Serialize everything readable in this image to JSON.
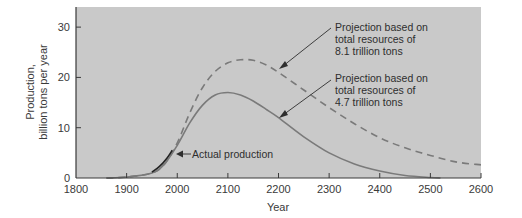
{
  "chart_data": {
    "type": "line",
    "title": "",
    "xlabel": "Year",
    "ylabel_lines": [
      "Production,",
      "billion tons per year"
    ],
    "ylabel": "Production, billion tons per year",
    "xlim": [
      1800,
      2600
    ],
    "ylim": [
      0,
      34
    ],
    "x_ticks": [
      1800,
      1900,
      2000,
      2100,
      2200,
      2300,
      2400,
      2500,
      2600
    ],
    "y_ticks": [
      0,
      10,
      20,
      30
    ],
    "grid": false,
    "background": "#c9c9c9",
    "series": [
      {
        "name": "Projection based on total resources of 4.7 trillion tons",
        "style": "solid",
        "color": "#7a7a7a",
        "x": [
          1860,
          1900,
          1950,
          1975,
          2000,
          2025,
          2050,
          2075,
          2100,
          2125,
          2150,
          2175,
          2200,
          2250,
          2300,
          2350,
          2400,
          2450,
          2500,
          2520
        ],
        "y": [
          0,
          0.2,
          1.0,
          2.8,
          6.5,
          11.0,
          14.5,
          16.5,
          17.0,
          16.5,
          15.3,
          13.7,
          12.0,
          8.2,
          5.0,
          2.8,
          1.4,
          0.5,
          0.1,
          0
        ]
      },
      {
        "name": "Projection based on total resources of 8.1 trillion tons",
        "style": "dashed",
        "color": "#7a7a7a",
        "x": [
          1860,
          1900,
          1950,
          1975,
          2000,
          2025,
          2050,
          2075,
          2100,
          2125,
          2150,
          2175,
          2200,
          2250,
          2300,
          2350,
          2400,
          2450,
          2500,
          2550,
          2600
        ],
        "y": [
          0,
          0.2,
          1.0,
          2.8,
          7.0,
          13.0,
          18.0,
          21.2,
          22.9,
          23.5,
          23.4,
          22.5,
          21.0,
          17.5,
          14.0,
          10.8,
          8.0,
          6.0,
          4.5,
          3.2,
          2.6
        ]
      },
      {
        "name": "Actual production",
        "style": "solid-dark",
        "color": "#222222",
        "x": [
          1950,
          1965,
          1980,
          1990
        ],
        "y": [
          1.2,
          2.3,
          4.0,
          5.5
        ]
      }
    ],
    "annotations": [
      {
        "lines": [
          "Projection based on",
          "total resources of",
          "8.1 trillion tons"
        ],
        "arrow_to": {
          "x": 2200,
          "y": 21.0
        }
      },
      {
        "lines": [
          "Projection based on",
          "total resources of",
          "4.7 trillion tons"
        ],
        "arrow_to": {
          "x": 2200,
          "y": 12.0
        }
      },
      {
        "lines": [
          "Actual production"
        ],
        "arrow_to": {
          "x": 1990,
          "y": 5.5
        }
      }
    ]
  },
  "labels": {
    "xlabel": "Year",
    "ylabel_1": "Production,",
    "ylabel_2": "billion tons per year",
    "ann_81_1": "Projection based on",
    "ann_81_2": "total resources of",
    "ann_81_3": "8.1 trillion tons",
    "ann_47_1": "Projection based on",
    "ann_47_2": "total resources of",
    "ann_47_3": "4.7 trillion tons",
    "ann_actual": "Actual production",
    "xt": [
      "1800",
      "1900",
      "2000",
      "2100",
      "2200",
      "2300",
      "2400",
      "2500",
      "2600"
    ],
    "yt": [
      "0",
      "10",
      "20",
      "30"
    ]
  }
}
